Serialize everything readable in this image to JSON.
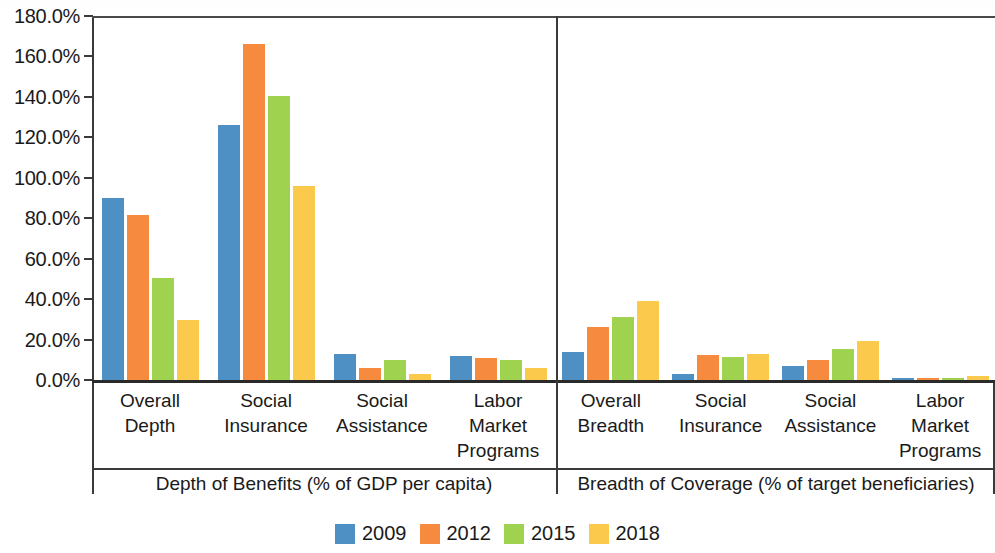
{
  "chart_data": {
    "type": "bar",
    "title": "",
    "xlabel": "",
    "ylabel": "",
    "ylim": [
      0,
      180
    ],
    "grid": false,
    "legend_position": "bottom",
    "y_ticks": [
      "0.0%",
      "20.0%",
      "40.0%",
      "60.0%",
      "80.0%",
      "100.0%",
      "120.0%",
      "140.0%",
      "160.0%",
      "180.0%"
    ],
    "y_tick_values": [
      0,
      20,
      40,
      60,
      80,
      100,
      120,
      140,
      160,
      180
    ],
    "series": [
      {
        "name": "2009",
        "color": "#4E8FC4",
        "values": [
          90.0,
          126.0,
          13.0,
          12.0,
          14.0,
          3.0,
          7.0,
          1.0
        ]
      },
      {
        "name": "2012",
        "color": "#F68B3F",
        "values": [
          81.5,
          166.0,
          6.0,
          11.0,
          26.0,
          12.5,
          10.0,
          1.0
        ]
      },
      {
        "name": "2015",
        "color": "#9ED24F",
        "values": [
          50.5,
          140.5,
          10.0,
          10.0,
          31.0,
          11.5,
          15.5,
          0.8
        ]
      },
      {
        "name": "2018",
        "color": "#FBC94B",
        "values": [
          29.5,
          96.0,
          3.0,
          6.0,
          39.0,
          13.0,
          19.5,
          2.0
        ]
      }
    ],
    "categories": [
      "Overall\nDepth",
      "Social\nInsurance",
      "Social\nAssistance",
      "Labor\nMarket\nPrograms",
      "Overall\nBreadth",
      "Social\nInsurance",
      "Social\nAssistance",
      "Labor\nMarket\nPrograms"
    ],
    "panels": [
      {
        "label": "Depth of Benefits (% of GDP per capita)",
        "category_start": 0,
        "category_end": 3
      },
      {
        "label": "Breadth of Coverage (% of target beneficiaries)",
        "category_start": 4,
        "category_end": 7
      }
    ]
  },
  "legend": {
    "items": [
      {
        "label": "2009",
        "color": "#4E8FC4"
      },
      {
        "label": "2012",
        "color": "#F68B3F"
      },
      {
        "label": "2015",
        "color": "#9ED24F"
      },
      {
        "label": "2018",
        "color": "#FBC94B"
      }
    ]
  }
}
